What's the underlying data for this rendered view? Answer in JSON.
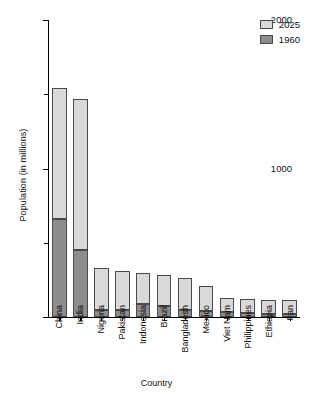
{
  "chart_data": {
    "type": "bar",
    "subtype": "stacked-vertical",
    "title": "",
    "xlabel": "Country",
    "ylabel": "Population (in millions)",
    "ylim": [
      0,
      2000
    ],
    "yticks_major": [
      0,
      1000,
      2000
    ],
    "yticks_minor": [
      500,
      1500
    ],
    "grid": false,
    "legend_position": "top-right",
    "categories": [
      "China",
      "India",
      "Nigeria",
      "Pakistan",
      "Indonesia",
      "Brazil",
      "Bangladesh",
      "Mexico",
      "Viet Nam",
      "Philippines",
      "Ethiopia",
      "Iran"
    ],
    "series": [
      {
        "name": "1960",
        "color": "#8d8d8d",
        "values": [
          660,
          450,
          45,
          45,
          88,
          72,
          50,
          38,
          32,
          26,
          22,
          22
        ]
      },
      {
        "name": "2025",
        "color": "#d9d9d9",
        "values": [
          1545,
          1470,
          332,
          312,
          295,
          285,
          263,
          208,
          128,
          119,
          116,
          113
        ]
      }
    ]
  },
  "legend": {
    "entries": [
      {
        "label": "2025",
        "color": "#d9d9d9"
      },
      {
        "label": "1960",
        "color": "#8d8d8d"
      }
    ]
  },
  "axes": {
    "y_tick_labels": [
      "2000",
      "1000",
      "0"
    ],
    "x_title": "Country",
    "y_title": "Population (in millions)"
  }
}
